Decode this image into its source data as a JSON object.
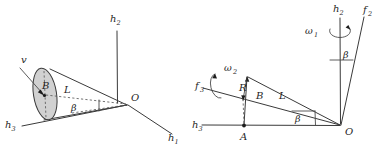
{
  "figure": {
    "caption": "",
    "background_color": "#ffffff",
    "line_color": "#3a3a3a",
    "fill_color": "#c9c9c9",
    "panels": [
      {
        "id": "left-panel",
        "name": "three-axis-cone-diagram",
        "axes": [
          {
            "name": "h2-axis",
            "label": "h",
            "subscript": "2",
            "direction": "vertical-up"
          },
          {
            "name": "h1-axis",
            "label": "h",
            "subscript": "1",
            "direction": "down-right"
          },
          {
            "name": "h3-axis",
            "label": "h",
            "subscript": "3",
            "direction": "left"
          }
        ],
        "labels": [
          {
            "name": "velocity-label",
            "text": "v"
          },
          {
            "name": "point-b-label",
            "text": "B"
          },
          {
            "name": "length-l-label",
            "text": "L"
          },
          {
            "name": "angle-beta-label",
            "text": "β"
          },
          {
            "name": "origin-o-label",
            "text": "O"
          }
        ]
      },
      {
        "id": "right-panel",
        "name": "two-axis-rotation-diagram",
        "axes": [
          {
            "name": "h2-axis",
            "label": "h",
            "subscript": "2",
            "direction": "vertical-up"
          },
          {
            "name": "h3-axis",
            "label": "h",
            "subscript": "3",
            "direction": "left"
          }
        ],
        "labels": [
          {
            "name": "omega1-label",
            "text": "ω",
            "subscript": "1"
          },
          {
            "name": "omega2-label",
            "text": "ω",
            "subscript": "2"
          },
          {
            "name": "f2-axis-label",
            "text": "f",
            "subscript": "2"
          },
          {
            "name": "f3-axis-label",
            "text": "f",
            "subscript": "3"
          },
          {
            "name": "radius-r-label",
            "text": "R"
          },
          {
            "name": "point-b-label",
            "text": "B"
          },
          {
            "name": "length-l-label",
            "text": "L"
          },
          {
            "name": "angle-beta-upper-label",
            "text": "β"
          },
          {
            "name": "angle-beta-lower-label",
            "text": "β"
          },
          {
            "name": "point-a-label",
            "text": "A"
          },
          {
            "name": "origin-o-label",
            "text": "O"
          }
        ]
      }
    ]
  },
  "left": {
    "h2": "h",
    "h2_sub": "2",
    "h1": "h",
    "h1_sub": "1",
    "h3": "h",
    "h3_sub": "3",
    "v": "v",
    "B": "B",
    "L": "L",
    "beta": "β",
    "O": "O"
  },
  "right": {
    "h2": "h",
    "h2_sub": "2",
    "h3": "h",
    "h3_sub": "3",
    "f2": "f",
    "f2_sub": "2",
    "f3": "f",
    "f3_sub": "3",
    "omega1": "ω",
    "omega1_sub": "1",
    "omega2": "ω",
    "omega2_sub": "2",
    "R": "R",
    "B": "B",
    "L": "L",
    "beta_upper": "β",
    "beta_lower": "β",
    "A": "A",
    "O": "O"
  }
}
